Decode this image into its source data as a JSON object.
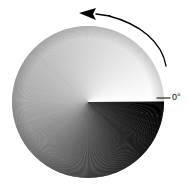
{
  "figure": {
    "name": "phase-angle-disc",
    "background_color": "#ffffff"
  },
  "disc": {
    "name": "conic-gradient-disc",
    "center_x": 88,
    "center_y": 102,
    "radius": 76,
    "gradient_type": "conic",
    "zero_angle_position": "right",
    "sweep_direction": "counter-clockwise",
    "edge_color": "#000000",
    "stops": [
      {
        "angle_deg": 0,
        "color": "#ffffff"
      },
      {
        "angle_deg": 45,
        "color": "#e8e8e8"
      },
      {
        "angle_deg": 90,
        "color": "#d2d2d2"
      },
      {
        "angle_deg": 135,
        "color": "#bdbdbd"
      },
      {
        "angle_deg": 180,
        "color": "#a8a8a8"
      },
      {
        "angle_deg": 225,
        "color": "#7d7d7d"
      },
      {
        "angle_deg": 270,
        "color": "#4a4a4a"
      },
      {
        "angle_deg": 315,
        "color": "#1e1e1e"
      },
      {
        "angle_deg": 360,
        "color": "#000000"
      }
    ]
  },
  "arrow": {
    "name": "counter-clockwise-direction-arrow",
    "color": "#000000",
    "stroke_width": 1.3,
    "direction": "counter-clockwise",
    "head_points_to": "left"
  },
  "leader": {
    "name": "zero-degree-leader-line",
    "color": "#000000",
    "stroke_width": 1.1,
    "x_start": 157,
    "x_end": 170,
    "y": 98
  },
  "labels": {
    "zero_degree": "0°"
  }
}
